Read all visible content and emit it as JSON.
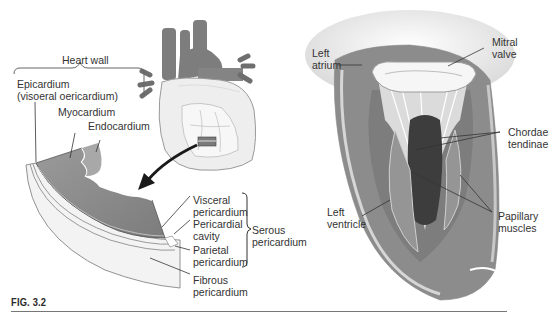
{
  "figure": {
    "caption": "FIG. 3.2",
    "left_panel": {
      "title": "Heart wall",
      "labels": {
        "epicardium": [
          "Epicardium",
          "(visoeral oericardium)"
        ],
        "myocardium": "Myocardium",
        "endocardium": "Endocardium",
        "visceral_pericardium": [
          "Visceral",
          "pericardium"
        ],
        "pericardial_cavity": [
          "Pericardial",
          "cavity"
        ],
        "parietal_pericardium": [
          "Parietal",
          "pericardium"
        ],
        "serous_pericardium": [
          "Serous",
          "pericardium"
        ],
        "fibrous_pericardium": [
          "Fibrous",
          "pericardium"
        ]
      }
    },
    "right_panel": {
      "labels": {
        "left_atrium": [
          "Left",
          "atrium"
        ],
        "mitral_valve": [
          "Mitral",
          "valve"
        ],
        "chordae_tendinae": [
          "Chordae",
          "tendinae"
        ],
        "left_ventricle": [
          "Left",
          "ventricle"
        ],
        "papillary_muscles": [
          "Papillary",
          "muscles"
        ]
      }
    },
    "colors": {
      "muscle": "#8a8a8a",
      "muscle_dark": "#6e6e6e",
      "vessel": "#7a7a7a",
      "pericardium": "#f2f2f2",
      "outline": "#555555",
      "leader": "#333333"
    }
  }
}
